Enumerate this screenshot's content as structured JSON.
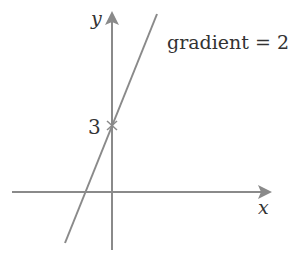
{
  "diagram": {
    "type": "straight-line-graph",
    "axes": {
      "x_label": "x",
      "y_label": "y"
    },
    "intercept": {
      "label": "3",
      "value": 3
    },
    "annotation": "gradient = 2",
    "line": {
      "gradient": 2,
      "y_intercept": 3
    },
    "colors": {
      "axis": "#8a8a8a",
      "line": "#8a8a8a",
      "text": "#333333",
      "background": "#ffffff"
    }
  }
}
